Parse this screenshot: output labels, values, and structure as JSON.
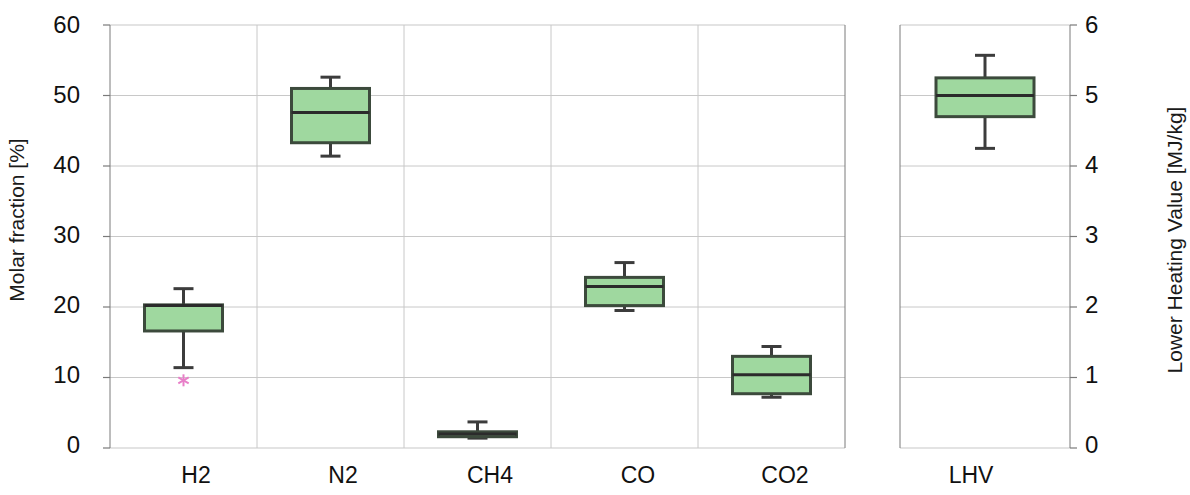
{
  "chart_data": {
    "type": "box",
    "title": "",
    "left_axis": {
      "label": "Molar fraction [%]",
      "ticks": [
        0,
        10,
        20,
        30,
        40,
        50,
        60
      ],
      "ylim": [
        0,
        60
      ],
      "tick_labels": [
        "0",
        "10",
        "20",
        "30",
        "40",
        "50",
        "60"
      ]
    },
    "right_axis": {
      "label": "Lower Heating Value [MJ/kg]",
      "ticks": [
        0,
        1,
        2,
        3,
        4,
        5,
        6
      ],
      "ylim": [
        0,
        6
      ],
      "tick_labels": [
        "0",
        "1",
        "2",
        "3",
        "4",
        "5",
        "6"
      ]
    },
    "categories": [
      "H2",
      "N2",
      "CH4",
      "CO",
      "CO2",
      "LHV"
    ],
    "xlabel": "",
    "grid": true,
    "legend": null,
    "panels": [
      {
        "name": "molar-fraction-panel",
        "axis": "left",
        "categories": [
          "H2",
          "N2",
          "CH4",
          "CO",
          "CO2"
        ]
      },
      {
        "name": "lhv-panel",
        "axis": "right",
        "categories": [
          "LHV"
        ]
      }
    ],
    "boxes": [
      {
        "category": "H2",
        "axis": "left",
        "whisker_low": 11.4,
        "q1": 16.6,
        "median": 20.2,
        "q3": 20.3,
        "whisker_high": 22.6,
        "outliers": [
          9.6
        ],
        "units": "%"
      },
      {
        "category": "N2",
        "axis": "left",
        "whisker_low": 41.4,
        "q1": 43.3,
        "median": 47.6,
        "q3": 51.0,
        "whisker_high": 52.6,
        "outliers": [],
        "units": "%"
      },
      {
        "category": "CH4",
        "axis": "left",
        "whisker_low": 1.4,
        "q1": 1.6,
        "median": 2.0,
        "q3": 2.3,
        "whisker_high": 3.7,
        "outliers": [],
        "units": "%"
      },
      {
        "category": "CO",
        "axis": "left",
        "whisker_low": 19.5,
        "q1": 20.2,
        "median": 22.9,
        "q3": 24.2,
        "whisker_high": 26.3,
        "outliers": [],
        "units": "%"
      },
      {
        "category": "CO2",
        "axis": "left",
        "whisker_low": 7.2,
        "q1": 7.7,
        "median": 10.4,
        "q3": 13.0,
        "whisker_high": 14.4,
        "outliers": [],
        "units": "%"
      },
      {
        "category": "LHV",
        "axis": "right",
        "whisker_low": 4.25,
        "q1": 4.7,
        "median": 5.0,
        "q3": 5.25,
        "whisker_high": 5.57,
        "outliers": [],
        "units": "MJ/kg"
      }
    ],
    "colors": {
      "box_fill": "#9fd89f",
      "box_stroke": "#3c4a3c",
      "whisker": "#3c3c3c",
      "median": "#2b2b2b",
      "grid": "#c8c8c8",
      "axis": "#7a7a7a",
      "outlier": "#e87fc8",
      "text": "#111111"
    }
  },
  "axes": {
    "left_title": "Molar fraction [%]",
    "right_title": "Lower Heating Value [MJ/kg]"
  },
  "left_ticks": [
    {
      "label": "60",
      "value": 60
    },
    {
      "label": "50",
      "value": 50
    },
    {
      "label": "40",
      "value": 40
    },
    {
      "label": "30",
      "value": 30
    },
    {
      "label": "20",
      "value": 20
    },
    {
      "label": "10",
      "value": 10
    },
    {
      "label": "0",
      "value": 0
    }
  ],
  "right_ticks": [
    {
      "label": "6",
      "value": 6
    },
    {
      "label": "5",
      "value": 5
    },
    {
      "label": "4",
      "value": 4
    },
    {
      "label": "3",
      "value": 3
    },
    {
      "label": "2",
      "value": 2
    },
    {
      "label": "1",
      "value": 1
    },
    {
      "label": "0",
      "value": 0
    }
  ],
  "category_labels": [
    {
      "label": "H2"
    },
    {
      "label": "N2"
    },
    {
      "label": "CH4"
    },
    {
      "label": "CO"
    },
    {
      "label": "CO2"
    },
    {
      "label": "LHV"
    }
  ]
}
